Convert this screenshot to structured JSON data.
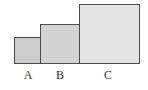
{
  "diagram": {
    "squares": [
      {
        "label": "A",
        "x": 14,
        "y": 37,
        "size": 27,
        "fill": "#cdcdcd"
      },
      {
        "label": "B",
        "x": 40,
        "y": 24,
        "size": 40,
        "fill": "#d2d2d2"
      },
      {
        "label": "C",
        "x": 79,
        "y": 4,
        "size": 60,
        "fill": "#e4e4e4"
      }
    ],
    "border_color": "#4a4a4a"
  }
}
